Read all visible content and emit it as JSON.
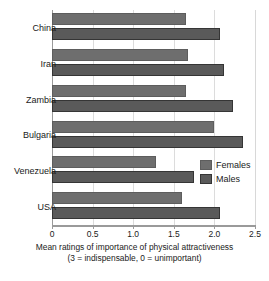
{
  "chart_data": {
    "type": "bar",
    "orientation": "horizontal",
    "title": "",
    "xlabel_line1": "Mean ratings of importance of physical attractiveness",
    "xlabel_line2": "(3 = indispensable, 0 = unimportant)",
    "ylabel": "",
    "categories": [
      "China",
      "Iran",
      "Zambia",
      "Bulgaria",
      "Venezuela",
      "USA"
    ],
    "series": [
      {
        "name": "Females",
        "color": "#6e6e6e",
        "values": [
          1.65,
          1.67,
          1.65,
          2.0,
          1.28,
          1.6
        ]
      },
      {
        "name": "Males",
        "color": "#5a5a5a",
        "values": [
          2.07,
          2.12,
          2.23,
          2.35,
          1.75,
          2.07
        ]
      }
    ],
    "xlim": [
      0,
      2.5
    ],
    "xticks": [
      0,
      0.5,
      1.0,
      1.5,
      2.0,
      2.5
    ],
    "xtick_labels": [
      "0",
      "0.5",
      "1.0",
      "1.5",
      "2.0",
      "2.5"
    ],
    "grid": true,
    "grid_axis": "x",
    "legend_position": "inside-right"
  }
}
